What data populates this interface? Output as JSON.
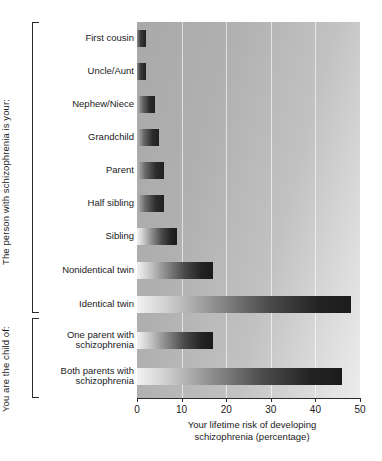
{
  "chart_data": {
    "type": "bar",
    "orientation": "horizontal",
    "title": "",
    "xlabel": "Your lifetime risk of developing\nschizophrenia (percentage)",
    "ylabel": "",
    "xlim": [
      0,
      50
    ],
    "xticks": [
      0,
      10,
      20,
      30,
      40,
      50
    ],
    "xtick_labels": [
      "0",
      "10",
      "20",
      "30",
      "40",
      "50"
    ],
    "grid": "vertical",
    "legend": "none",
    "categories": [
      "First cousin",
      "Uncle/Aunt",
      "Nephew/Niece",
      "Grandchild",
      "Parent",
      "Half sibling",
      "Sibling",
      "Nonidentical twin",
      "Identical twin",
      "One parent with\nschizophrenia",
      "Both parents with\nschizophrenia"
    ],
    "values": [
      2,
      2,
      4,
      5,
      6,
      6,
      9,
      17,
      48,
      17,
      46
    ],
    "groups": [
      {
        "label": "The person with schizophrenia is your:",
        "categories": [
          "First cousin",
          "Uncle/Aunt",
          "Nephew/Niece",
          "Grandchild",
          "Parent",
          "Half sibling",
          "Sibling",
          "Nonidentical twin",
          "Identical twin"
        ]
      },
      {
        "label": "You are the child of:",
        "categories": [
          "One parent with\nschizophrenia",
          "Both parents with\nschizophrenia"
        ]
      }
    ],
    "bar_style": "gradient light-to-dark grey",
    "plot_background": "grey gradient",
    "colors": {
      "bar_light": "#f2f2f2",
      "bar_dark": "#1b1b1b",
      "plot_bg_light": "#ececec",
      "plot_bg_dark": "#a9a9a9",
      "gridline": "#ffffff",
      "axis": "#2b2b2b",
      "text": "#1a1a1a"
    }
  },
  "axis": {
    "x_title": "Your lifetime risk of developing\nschizophrenia (percentage)",
    "ticks": [
      {
        "value": 0,
        "label": "0"
      },
      {
        "value": 10,
        "label": "10"
      },
      {
        "value": 20,
        "label": "20"
      },
      {
        "value": 30,
        "label": "30"
      },
      {
        "value": 40,
        "label": "40"
      },
      {
        "value": 50,
        "label": "50"
      }
    ]
  },
  "groups": {
    "relatives": {
      "caption": "The person with schizophrenia is your:"
    },
    "children": {
      "caption": "You are the child of:"
    }
  },
  "rows": [
    {
      "label": "First cousin",
      "value": 2
    },
    {
      "label": "Uncle/Aunt",
      "value": 2
    },
    {
      "label": "Nephew/Niece",
      "value": 4
    },
    {
      "label": "Grandchild",
      "value": 5
    },
    {
      "label": "Parent",
      "value": 6
    },
    {
      "label": "Half sibling",
      "value": 6
    },
    {
      "label": "Sibling",
      "value": 9
    },
    {
      "label": "Nonidentical twin",
      "value": 17
    },
    {
      "label": "Identical twin",
      "value": 48
    },
    {
      "label": "One parent with\nschizophrenia",
      "value": 17
    },
    {
      "label": "Both parents with\nschizophrenia",
      "value": 46
    }
  ]
}
